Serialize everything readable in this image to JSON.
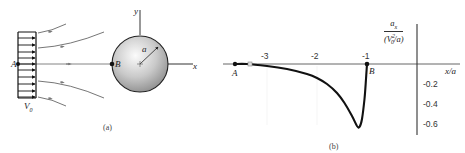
{
  "panel_a": {
    "caption": "(a)",
    "labels": {
      "point_a": "A",
      "point_b": "B",
      "velocity": "V",
      "velocity_sub": "0",
      "radius": "a",
      "x_axis": "x",
      "y_axis": "y"
    }
  },
  "panel_b": {
    "caption": "(b)",
    "labels": {
      "point_a": "A",
      "point_b": "B",
      "x_axis": "x/a",
      "y_num": "a",
      "y_num_sub": "x",
      "y_den": "(V",
      "y_den_sup": "2",
      "y_den_sub": "0",
      "y_den_tail": "/a)"
    },
    "x_ticks": [
      "-3",
      "-2",
      "-1"
    ],
    "y_ticks": [
      "-0.2",
      "-0.4",
      "-0.6"
    ]
  },
  "colors": {
    "curve": "#111111",
    "axis": "#333333",
    "streamline": "#555555",
    "sphere_light": "#f4f4f4",
    "sphere_dark": "#8c8c8c"
  },
  "chart_data": {
    "type": "line",
    "title": "",
    "xlabel": "x/a",
    "ylabel": "a_x / (V0^2/a)",
    "xlim": [
      -3.7,
      0.3
    ],
    "ylim": [
      -0.7,
      0.0
    ],
    "x_ticks": [
      -3,
      -2,
      -1
    ],
    "y_ticks": [
      -0.2,
      -0.4,
      -0.6
    ],
    "grid": false,
    "legend": null,
    "annotations": [
      {
        "text": "A",
        "x": -3.65,
        "y": 0.0
      },
      {
        "text": "B",
        "x": -1.0,
        "y": 0.0
      }
    ],
    "series": [
      {
        "name": "a_x/(V0^2/a)",
        "x": [
          -3.65,
          -3.4,
          -3.0,
          -2.6,
          -2.2,
          -2.0,
          -1.8,
          -1.6,
          -1.45,
          -1.3,
          -1.2,
          -1.15,
          -1.1,
          -1.05,
          -1.02,
          -1.0
        ],
        "y": [
          0.0,
          0.0,
          -0.02,
          -0.05,
          -0.1,
          -0.14,
          -0.2,
          -0.29,
          -0.39,
          -0.52,
          -0.62,
          -0.63,
          -0.55,
          -0.35,
          -0.15,
          0.0
        ]
      }
    ]
  }
}
